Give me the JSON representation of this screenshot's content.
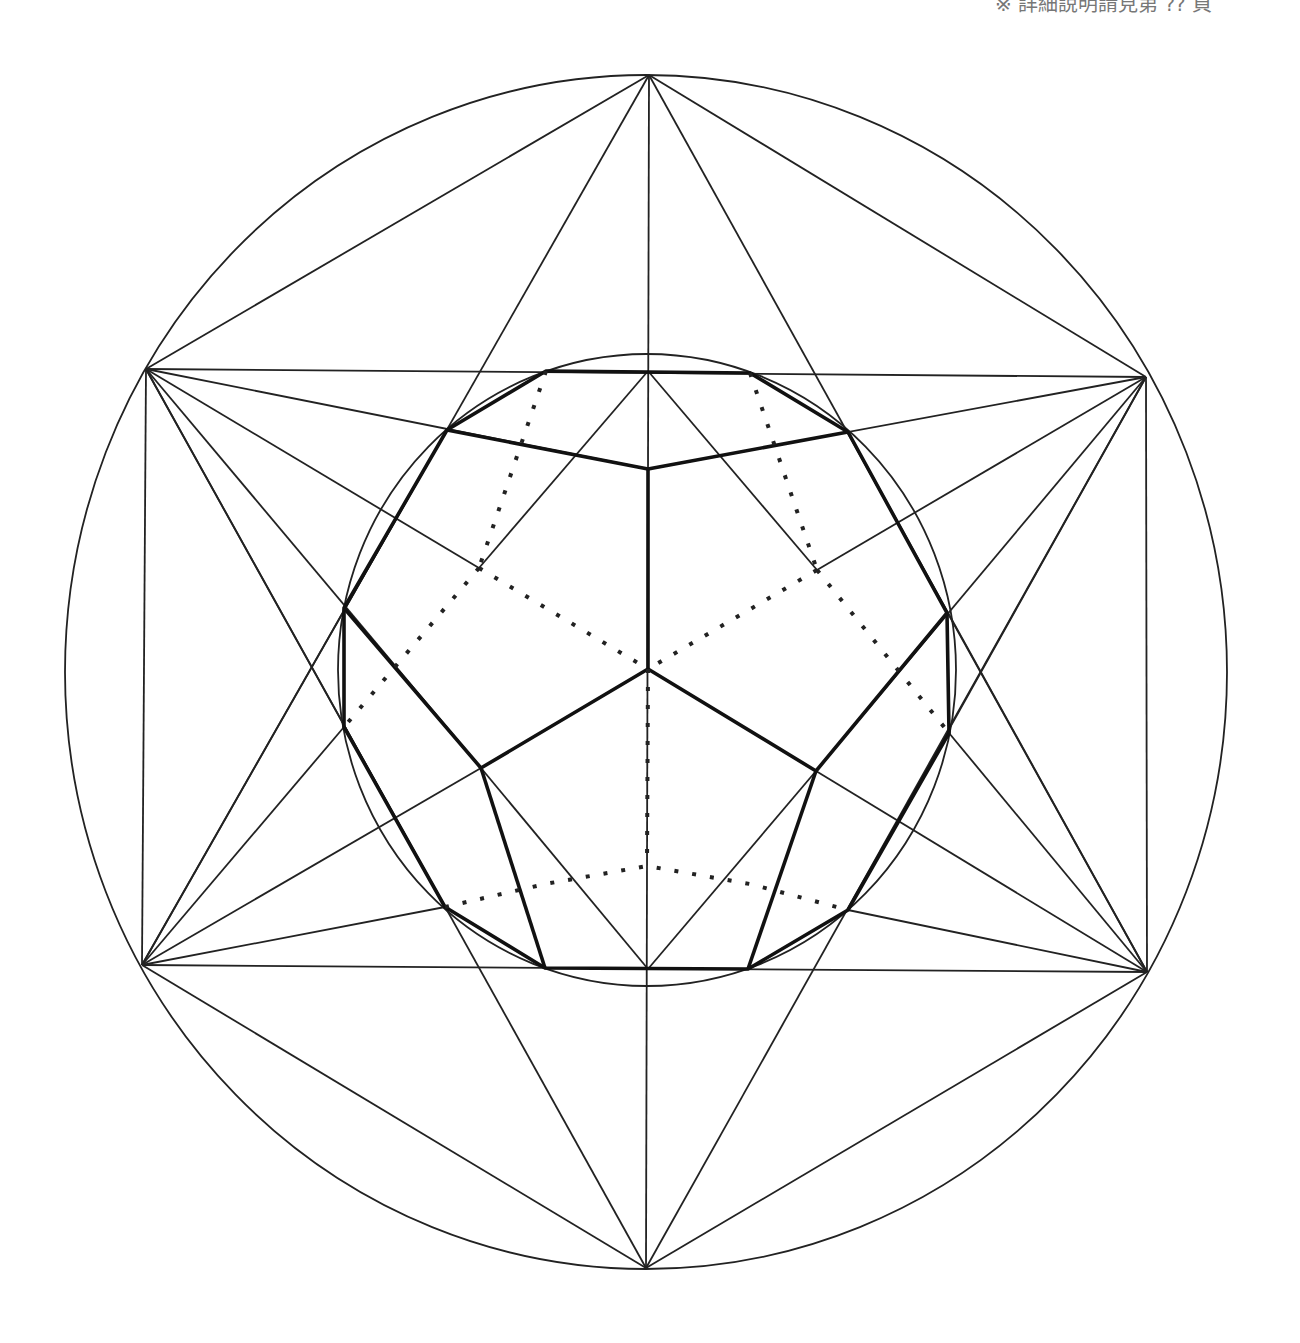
{
  "caption": "※ 詳細說明請見第 ?? 頁",
  "figure": {
    "outer_circle": {
      "cx": 646,
      "cy": 671,
      "r": 581
    },
    "inner_circle": {
      "cx": 647,
      "cy": 670,
      "rx": 309,
      "ry": 316
    },
    "hexagon_points": {
      "T": [
        649,
        75
      ],
      "UL": [
        146,
        369
      ],
      "UR": [
        1146,
        377
      ],
      "LL": [
        142,
        965
      ],
      "LR": [
        1147,
        972
      ],
      "B": [
        646,
        1268
      ]
    },
    "thick_polygon_points": [
      [
        546,
        371
      ],
      [
        750,
        373
      ],
      [
        848,
        432
      ],
      [
        947,
        613
      ],
      [
        949,
        733
      ],
      [
        816,
        771
      ],
      [
        748,
        969
      ],
      [
        545,
        968
      ],
      [
        481,
        768
      ],
      [
        344,
        727
      ],
      [
        344,
        608
      ],
      [
        447,
        430
      ]
    ],
    "center": [
      648,
      669
    ]
  }
}
